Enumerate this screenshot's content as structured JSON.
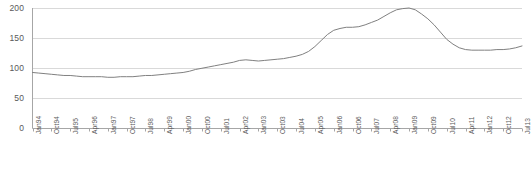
{
  "chart_data": {
    "type": "line",
    "title": "",
    "subtitle": "",
    "xlabel": "",
    "ylabel": "",
    "ylim": [
      0,
      200
    ],
    "yticks": [
      0,
      50,
      100,
      150,
      200
    ],
    "grid": true,
    "legend": null,
    "legend_position": "none",
    "line_color": "#808080",
    "gridline_color": "#d9d9d9",
    "axis_color": "#a6a6a6",
    "tick_label_color": "#595959",
    "x_tick_interval_months": 9,
    "x_data_interval_months": 3,
    "x_start": "Jan94",
    "x_end": "Jul13",
    "xticks": [
      "Jan94",
      "Oct94",
      "Jul95",
      "Apr96",
      "Jan97",
      "Oct97",
      "Jul98",
      "Apr99",
      "Jan00",
      "Oct00",
      "Jul01",
      "Apr02",
      "Jan03",
      "Oct03",
      "Jul04",
      "Apr05",
      "Jan06",
      "Oct06",
      "Jul07",
      "Apr08",
      "Jan09",
      "Oct09",
      "Jul10",
      "Apr11",
      "Jan12",
      "Oct12",
      "Jul13"
    ],
    "x": [
      "Jan94",
      "Apr94",
      "Jul94",
      "Oct94",
      "Jan95",
      "Apr95",
      "Jul95",
      "Oct95",
      "Jan96",
      "Apr96",
      "Jul96",
      "Oct96",
      "Jan97",
      "Apr97",
      "Jul97",
      "Oct97",
      "Jan98",
      "Apr98",
      "Jul98",
      "Oct98",
      "Jan99",
      "Apr99",
      "Jul99",
      "Oct99",
      "Jan00",
      "Apr00",
      "Jul00",
      "Oct00",
      "Jan01",
      "Apr01",
      "Jul01",
      "Oct01",
      "Jan02",
      "Apr02",
      "Jul02",
      "Oct02",
      "Jan03",
      "Apr03",
      "Jul03",
      "Oct03",
      "Jan04",
      "Apr04",
      "Jul04",
      "Oct04",
      "Jan05",
      "Apr05",
      "Jul05",
      "Oct05",
      "Jan06",
      "Apr06",
      "Jul06",
      "Oct06",
      "Jan07",
      "Apr07",
      "Jul07",
      "Oct07",
      "Jan08",
      "Apr08",
      "Jul08",
      "Oct08",
      "Jan09",
      "Apr09",
      "Jul09",
      "Oct09",
      "Jan10",
      "Apr10",
      "Jul10",
      "Oct10",
      "Jan11",
      "Apr11",
      "Jul11",
      "Oct11",
      "Jan12",
      "Apr12",
      "Jul12",
      "Oct12",
      "Jan13",
      "Apr13",
      "Jul13"
    ],
    "values": [
      93,
      92,
      91,
      90,
      89,
      88,
      88,
      87,
      86,
      86,
      86,
      86,
      85,
      85,
      86,
      86,
      86,
      87,
      88,
      88,
      89,
      90,
      91,
      92,
      93,
      95,
      98,
      100,
      102,
      104,
      106,
      108,
      110,
      113,
      114,
      113,
      112,
      113,
      114,
      115,
      116,
      118,
      120,
      123,
      128,
      136,
      146,
      156,
      163,
      166,
      168,
      168,
      169,
      172,
      176,
      180,
      186,
      192,
      197,
      199,
      200,
      197,
      190,
      182,
      172,
      160,
      148,
      140,
      134,
      131,
      130,
      130,
      130,
      130,
      131,
      131,
      132,
      134,
      137
    ],
    "data_note": "quarterly series, index level"
  }
}
